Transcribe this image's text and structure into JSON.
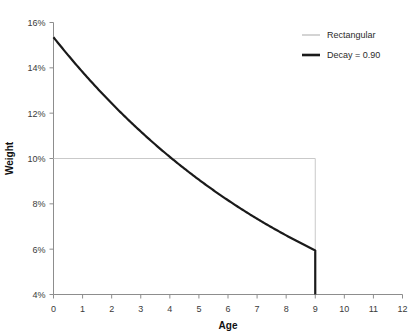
{
  "chart_data": {
    "type": "line",
    "title": "",
    "xlabel": "Age",
    "ylabel": "Weight",
    "xlim": [
      0,
      12
    ],
    "ylim": [
      0.04,
      0.16
    ],
    "xticks": [
      0,
      1,
      2,
      3,
      4,
      5,
      6,
      7,
      8,
      9,
      10,
      11,
      12
    ],
    "xticklabels": [
      "0",
      "1",
      "2",
      "3",
      "4",
      "5",
      "6",
      "7",
      "8",
      "9",
      "10",
      "11",
      "12"
    ],
    "yticks": [
      0.04,
      0.06,
      0.08,
      0.1,
      0.12,
      0.14,
      0.16
    ],
    "yticklabels": [
      "4%",
      "6%",
      "8%",
      "10%",
      "12%",
      "14%",
      "16%"
    ],
    "grid": false,
    "legend_position": "top-right",
    "series": [
      {
        "name": "Rectangular",
        "color": "#c9c9c9",
        "linewidth": 1,
        "x": [
          0,
          1,
          2,
          3,
          4,
          5,
          6,
          7,
          8,
          9,
          9
        ],
        "values": [
          0.1,
          0.1,
          0.1,
          0.1,
          0.1,
          0.1,
          0.1,
          0.1,
          0.1,
          0.1,
          0.04
        ]
      },
      {
        "name": "Decay = 0.90",
        "color": "#1a1a1a",
        "linewidth": 2.2,
        "x": [
          0,
          1,
          2,
          3,
          4,
          5,
          6,
          7,
          8,
          9,
          9
        ],
        "values": [
          0.1535,
          0.1382,
          0.1243,
          0.1119,
          0.1007,
          0.0907,
          0.0816,
          0.0734,
          0.0661,
          0.0595,
          0.04
        ]
      }
    ]
  },
  "legend": {
    "entries": [
      {
        "label": "Rectangular",
        "color": "#c9c9c9"
      },
      {
        "label": "Decay = 0.90",
        "color": "#1a1a1a"
      }
    ]
  },
  "axes": {
    "x_title": "Age",
    "y_title": "Weight"
  }
}
